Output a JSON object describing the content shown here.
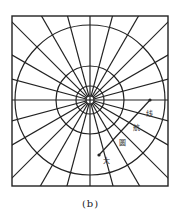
{
  "figure": {
    "caption": "(b)",
    "frame": {
      "x": 12,
      "y": 16,
      "width": 156,
      "height": 170
    },
    "center": {
      "x": 90,
      "y": 100
    },
    "parallel_radii": [
      4,
      14,
      34,
      75
    ],
    "meridian_count": 24,
    "meridian_step_deg": 15,
    "great_circle_route": {
      "label": "大圆航线",
      "characters": [
        "大",
        "圆",
        "航",
        "线"
      ],
      "start": {
        "x": 150,
        "y": 100
      },
      "end": {
        "x": 99,
        "y": 155
      }
    },
    "line_color": "#222222"
  }
}
